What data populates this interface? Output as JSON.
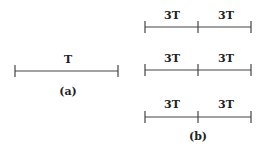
{
  "diagram": {
    "panel_a": {
      "segment_label": "T",
      "caption": "(a)"
    },
    "panel_b": {
      "rows": [
        {
          "left_label": "3T",
          "right_label": "3T"
        },
        {
          "left_label": "3T",
          "right_label": "3T"
        },
        {
          "left_label": "3T",
          "right_label": "3T"
        }
      ],
      "caption": "(b)"
    },
    "colors": {
      "line": "#444444",
      "text": "#222222",
      "background": "#ffffff"
    }
  }
}
